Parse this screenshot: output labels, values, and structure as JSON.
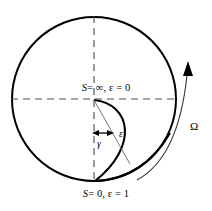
{
  "figure": {
    "name": "rotating-sphere-cross-section-diagram",
    "background_color": "#ffffff",
    "stroke_color": "#000000",
    "thin_stroke_color": "#555555",
    "dash_color": "#4d4d4d",
    "width": 212,
    "height": 211
  },
  "labels": {
    "top_boundary": {
      "full": "S = ∞, ε = 0",
      "symbol": "S",
      "equals_infinity": "= ∞,",
      "epsilon_term": "ε = 0"
    },
    "bottom_boundary": {
      "full": "S = 0, ε = 1",
      "symbol": "S",
      "equals_zero": "= 0,",
      "epsilon_term": "ε = 1"
    },
    "gamma": "γ",
    "epsilon": "ε",
    "omega": "Ω"
  },
  "geometry": {
    "outer_circle": {
      "cx": 94,
      "cy": 99,
      "r": 82
    },
    "center_point": {
      "x": 94,
      "y": 99
    },
    "horizontal_axis": {
      "x1": 12,
      "y1": 99,
      "x2": 176,
      "y2": 99
    },
    "vertical_axis": {
      "x1": 94,
      "y1": 17,
      "x2": 94,
      "y2": 181
    },
    "gamma_arrow": {
      "x1": 92,
      "y1": 133,
      "x2": 114,
      "y2": 133
    },
    "epsilon_line": {
      "x1": 94,
      "y1": 100,
      "x2": 129,
      "y2": 163
    },
    "omega_arrow_tip": {
      "x": 188,
      "y": 62
    }
  }
}
